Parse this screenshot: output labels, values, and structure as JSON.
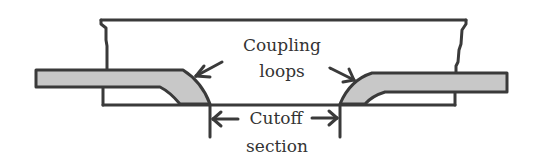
{
  "diagram": {
    "labels": {
      "coupling_line1": "Coupling",
      "coupling_line2": "loops",
      "cutoff_line1": "Cutoff",
      "cutoff_line2": "section"
    },
    "colors": {
      "stroke": "#3a3a3a",
      "probe_fill": "#c8c8c8",
      "background": "#ffffff",
      "text": "#333333"
    },
    "elements": [
      "waveguide-housing",
      "left-coupling-probe",
      "right-coupling-probe",
      "left-coupling-arrow",
      "right-coupling-arrow",
      "cutoff-dimension-left",
      "cutoff-dimension-right"
    ]
  }
}
